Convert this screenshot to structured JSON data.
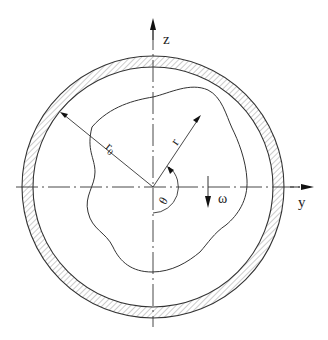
{
  "diagram": {
    "axes": {
      "z_label": "z",
      "y_label": "y"
    },
    "labels": {
      "outer_radius": "r",
      "outer_radius_sub": "0",
      "radius": "r",
      "angle": "θ",
      "rotation": "ω"
    },
    "geometry": {
      "center": [
        153,
        187
      ],
      "pipe_outer_radius": 131,
      "pipe_inner_radius": 120
    },
    "colors": {
      "line": "#333333",
      "hatch": "#888888",
      "background": "#ffffff"
    }
  }
}
